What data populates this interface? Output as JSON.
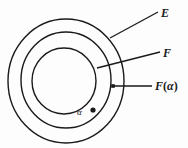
{
  "figure": {
    "type": "diagram",
    "background_color": "#fdfdfd",
    "stroke_color": "#1a1a1a",
    "labels": {
      "outer": "E",
      "inner": "F",
      "middle_base": "F",
      "middle_arg_open": "(",
      "middle_arg": "α",
      "middle_arg_close": ")",
      "point": "α"
    },
    "circles": [
      {
        "name": "outer-circle",
        "label": "E",
        "cx": 66,
        "cy": 81,
        "rx": 58,
        "ry": 62
      },
      {
        "name": "middle-circle",
        "label": "F(α)",
        "cx": 66,
        "cy": 80,
        "rx": 45,
        "ry": 48
      },
      {
        "name": "inner-circle",
        "label": "F",
        "cx": 64,
        "cy": 81,
        "rx": 32,
        "ry": 33
      }
    ],
    "point_marker": {
      "name": "alpha-point",
      "cx": 93,
      "cy": 110,
      "r": 2.6
    },
    "leader_lines": [
      {
        "name": "leader-E",
        "x1": 158,
        "y1": 12,
        "x2": 110,
        "y2": 38
      },
      {
        "name": "leader-F",
        "x1": 160,
        "y1": 52,
        "x2": 97,
        "y2": 68
      },
      {
        "name": "leader-F-alpha",
        "x1": 152,
        "y1": 86,
        "x2": 113,
        "y2": 86
      }
    ]
  }
}
